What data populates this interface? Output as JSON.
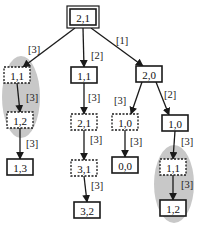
{
  "diagram": {
    "title": "",
    "nodes": [
      {
        "id": "n0",
        "label": "2,1",
        "style": "double",
        "x": 83,
        "y": 17
      },
      {
        "id": "n1",
        "label": "1,1",
        "style": "dotted",
        "x": 17,
        "y": 75
      },
      {
        "id": "n2",
        "label": "1,1",
        "style": "solid",
        "x": 84,
        "y": 75
      },
      {
        "id": "n3",
        "label": "2,0",
        "style": "solid",
        "x": 149,
        "y": 74
      },
      {
        "id": "n4",
        "label": "1,2",
        "style": "dotted",
        "x": 20,
        "y": 120
      },
      {
        "id": "n5",
        "label": "1,3",
        "style": "solid",
        "x": 20,
        "y": 167
      },
      {
        "id": "n6",
        "label": "2,1",
        "style": "dotted",
        "x": 84,
        "y": 122
      },
      {
        "id": "n7",
        "label": "3,1",
        "style": "dotted",
        "x": 84,
        "y": 168
      },
      {
        "id": "n8",
        "label": "3,2",
        "style": "solid",
        "x": 87,
        "y": 210
      },
      {
        "id": "n9",
        "label": "1,0",
        "style": "dotted",
        "x": 125,
        "y": 122
      },
      {
        "id": "n10",
        "label": "0,0",
        "style": "solid",
        "x": 125,
        "y": 165
      },
      {
        "id": "n11",
        "label": "1,0",
        "style": "solid",
        "x": 175,
        "y": 123
      },
      {
        "id": "n12",
        "label": "1,1",
        "style": "dotted",
        "x": 173,
        "y": 167
      },
      {
        "id": "n13",
        "label": "1,2",
        "style": "solid",
        "x": 173,
        "y": 208
      }
    ],
    "edges": [
      {
        "from": "n0",
        "to": "n1",
        "label": "[3]",
        "lx": 28,
        "ly": 53
      },
      {
        "from": "n0",
        "to": "n2",
        "label": "[2]",
        "lx": 91,
        "ly": 59
      },
      {
        "from": "n0",
        "to": "n3",
        "label": "[1]",
        "lx": 116,
        "ly": 44
      },
      {
        "from": "n1",
        "to": "n4",
        "label": "[3]",
        "lx": 26,
        "ly": 101
      },
      {
        "from": "n4",
        "to": "n5",
        "label": "[3]",
        "lx": 26,
        "ly": 147
      },
      {
        "from": "n2",
        "to": "n6",
        "label": "[3]",
        "lx": 88,
        "ly": 101
      },
      {
        "from": "n6",
        "to": "n7",
        "label": "[3]",
        "lx": 90,
        "ly": 143
      },
      {
        "from": "n7",
        "to": "n8",
        "label": "[3]",
        "lx": 91,
        "ly": 189
      },
      {
        "from": "n3",
        "to": "n9",
        "label": "[3]",
        "lx": 114,
        "ly": 104
      },
      {
        "from": "n3",
        "to": "n11",
        "label": "[2]",
        "lx": 164,
        "ly": 98
      },
      {
        "from": "n9",
        "to": "n10",
        "label": "[3]",
        "lx": 130,
        "ly": 145
      },
      {
        "from": "n11",
        "to": "n12",
        "label": "[3]",
        "lx": 181,
        "ly": 145
      },
      {
        "from": "n12",
        "to": "n13",
        "label": "[3]",
        "lx": 181,
        "ly": 188
      }
    ],
    "highlights": [
      {
        "name": "left-group",
        "cx": 21,
        "cy": 97,
        "rx": 19,
        "ry": 41
      },
      {
        "name": "right-group",
        "cx": 174,
        "cy": 184,
        "rx": 20,
        "ry": 39
      }
    ],
    "colors": {
      "highlight": "#c8c8c8",
      "stroke": "#1a1a1a"
    }
  }
}
